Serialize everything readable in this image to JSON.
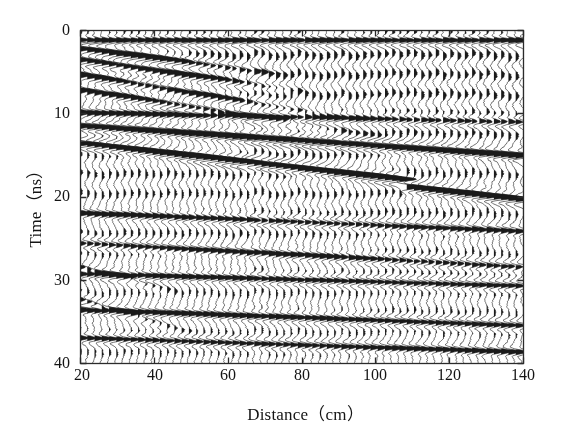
{
  "figure": {
    "kind": "gpr-wiggle-trace-radargram",
    "background_color": "#ffffff",
    "trace_color": "#1c1c1c",
    "fill_color": "#1a1a1a",
    "axis_color": "#2b2b2b"
  },
  "axes": {
    "x_label": "Distance（cm）",
    "y_label": "Time（ns）",
    "x_ticks": [
      {
        "value": 20,
        "label": "20"
      },
      {
        "value": 40,
        "label": "40"
      },
      {
        "value": 60,
        "label": "60"
      },
      {
        "value": 80,
        "label": "80"
      },
      {
        "value": 100,
        "label": "100"
      },
      {
        "value": 120,
        "label": "120"
      },
      {
        "value": 140,
        "label": "140"
      }
    ],
    "y_ticks": [
      {
        "value": 0,
        "label": "0"
      },
      {
        "value": 10,
        "label": "10"
      },
      {
        "value": 20,
        "label": "20"
      },
      {
        "value": 30,
        "label": "30"
      },
      {
        "value": 40,
        "label": "40"
      }
    ]
  },
  "chart_data": {
    "type": "line",
    "title": "",
    "subtitle": "",
    "xlabel": "Distance（cm）",
    "ylabel": "Time（ns）",
    "xlim": [
      20,
      140
    ],
    "ylim": [
      40,
      0
    ],
    "y_inverted": true,
    "grid": false,
    "legend": null,
    "annotations": [],
    "display_style": "wiggle-trace-variable-area",
    "trace_count": 62,
    "trace_spacing_cm": 1.967,
    "trace_start_cm": 20,
    "samples_per_trace": 420,
    "time_start_ns": 0,
    "time_end_ns": 40,
    "trace_gain": 1.0,
    "wavelet": {
      "type": "ricker",
      "center_frequency_ghz": 0.42,
      "period_ns": 2.38
    },
    "background_ringing": {
      "period_ns": 2.38,
      "amplitude": 0.3,
      "decay_ns": 46,
      "description": "near-continuous horizontal ringing present across all traces"
    },
    "noise_amplitude": 0.055,
    "events": [
      {
        "name": "direct-wave-airwave",
        "t0_ns": 1.25,
        "slope_ns_per_cm": 0.0,
        "amplitude": 0.95,
        "x_start_cm": 20,
        "x_end_cm": 140,
        "taper": "none"
      },
      {
        "name": "dipping-reflector-A",
        "t0_ns": 2.2,
        "slope_ns_per_cm": 0.058,
        "amplitude": 1.15,
        "x_start_cm": 20,
        "x_end_cm": 78,
        "taper": "right"
      },
      {
        "name": "dipping-reflector-B",
        "t0_ns": 3.6,
        "slope_ns_per_cm": 0.062,
        "amplitude": 1.05,
        "x_start_cm": 20,
        "x_end_cm": 84,
        "taper": "right"
      },
      {
        "name": "dipping-reflector-C",
        "t0_ns": 5.4,
        "slope_ns_per_cm": 0.072,
        "amplitude": 0.85,
        "x_start_cm": 20,
        "x_end_cm": 96,
        "taper": "right"
      },
      {
        "name": "dipping-reflector-D",
        "t0_ns": 7.2,
        "slope_ns_per_cm": 0.068,
        "amplitude": 0.8,
        "x_start_cm": 20,
        "x_end_cm": 108,
        "taper": "right"
      },
      {
        "name": "strong-reflector-E",
        "t0_ns": 11.5,
        "slope_ns_per_cm": 0.03,
        "amplitude": 1.45,
        "x_start_cm": 20,
        "x_end_cm": 140,
        "taper": "none"
      },
      {
        "name": "strong-reflector-F",
        "t0_ns": 13.6,
        "slope_ns_per_cm": 0.05,
        "amplitude": 1.5,
        "x_start_cm": 20,
        "x_end_cm": 140,
        "taper": "none",
        "step": {
          "x_cm": 107,
          "delta_ns": 0.8
        }
      },
      {
        "name": "reflector-G",
        "t0_ns": 9.9,
        "slope_ns_per_cm": 0.01,
        "amplitude": 0.7,
        "x_start_cm": 20,
        "x_end_cm": 140,
        "taper": "none"
      },
      {
        "name": "reflector-H",
        "t0_ns": 22.0,
        "slope_ns_per_cm": 0.018,
        "amplitude": 0.75,
        "x_start_cm": 20,
        "x_end_cm": 140,
        "taper": "none"
      },
      {
        "name": "reflector-I",
        "t0_ns": 25.6,
        "slope_ns_per_cm": 0.024,
        "amplitude": 0.72,
        "x_start_cm": 20,
        "x_end_cm": 140,
        "taper": "none"
      },
      {
        "name": "reflector-J",
        "t0_ns": 29.3,
        "slope_ns_per_cm": 0.012,
        "amplitude": 0.85,
        "x_start_cm": 20,
        "x_end_cm": 140,
        "taper": "none"
      },
      {
        "name": "reflector-K",
        "t0_ns": 33.6,
        "slope_ns_per_cm": 0.016,
        "amplitude": 0.9,
        "x_start_cm": 20,
        "x_end_cm": 140,
        "taper": "none"
      },
      {
        "name": "reflector-L",
        "t0_ns": 37.0,
        "slope_ns_per_cm": 0.014,
        "amplitude": 0.8,
        "x_start_cm": 20,
        "x_end_cm": 140,
        "taper": "none"
      },
      {
        "name": "left-dipping-shallow-M",
        "t0_ns": 28.5,
        "slope_ns_per_cm": 0.11,
        "amplitude": 0.65,
        "x_start_cm": 20,
        "x_end_cm": 48,
        "taper": "right"
      },
      {
        "name": "left-dipping-shallow-N",
        "t0_ns": 32.4,
        "slope_ns_per_cm": 0.13,
        "amplitude": 0.6,
        "x_start_cm": 20,
        "x_end_cm": 52,
        "taper": "right"
      }
    ]
  },
  "geometry": {
    "plot_left_px": 80,
    "plot_top_px": 30,
    "plot_right_px": 523,
    "plot_bottom_px": 363
  }
}
